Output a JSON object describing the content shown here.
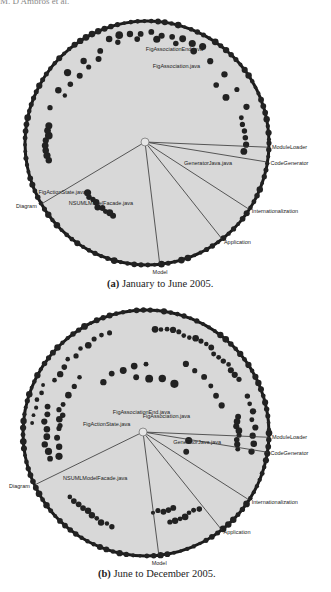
{
  "header": {
    "running_text": "M. D'Ambros et al."
  },
  "chart_data": [
    {
      "type": "radial-graph",
      "id": "a",
      "caption_prefix": "(a)",
      "caption_text": "January to June 2005.",
      "hub": {
        "name": "ArgoUML"
      },
      "module_labels": [
        {
          "name": "ModuleLoader",
          "angle_deg": 2
        },
        {
          "name": "CodeGenerator",
          "angle_deg": 9
        },
        {
          "name": "Internationalization",
          "angle_deg": 33
        },
        {
          "name": "Application",
          "angle_deg": 52
        },
        {
          "name": "Model",
          "angle_deg": 84
        },
        {
          "name": "Diagram",
          "angle_deg": 150
        }
      ],
      "file_labels": [
        {
          "name": "FigAssociationEnd.java",
          "angle_deg": -72,
          "r": 0.78
        },
        {
          "name": "FigAssociation.java",
          "angle_deg": -67,
          "r": 0.66
        },
        {
          "name": "GeneratorJava.java",
          "angle_deg": 20,
          "r": 0.55
        },
        {
          "name": "FigActionState.java",
          "angle_deg": 148,
          "r": 0.8
        },
        {
          "name": "NSUMLModelFacade.java",
          "angle_deg": 125,
          "r": 0.63
        }
      ]
    },
    {
      "type": "radial-graph",
      "id": "b",
      "caption_prefix": "(b)",
      "caption_text": "June to December 2005.",
      "hub": {
        "name": "ArgoUML"
      },
      "module_labels": [
        {
          "name": "ModuleLoader",
          "angle_deg": 2
        },
        {
          "name": "CodeGenerator",
          "angle_deg": 9
        },
        {
          "name": "Internationalization",
          "angle_deg": 33
        },
        {
          "name": "Application",
          "angle_deg": 52
        },
        {
          "name": "Model",
          "angle_deg": 84
        },
        {
          "name": "Diagram",
          "angle_deg": 155
        }
      ],
      "file_labels": [
        {
          "name": "FigAssociationEnd.java",
          "angle_deg": -95,
          "r": 0.15
        },
        {
          "name": "FigAssociation.java",
          "angle_deg": -30,
          "r": 0.22
        },
        {
          "name": "GeneratorJava.java",
          "angle_deg": 12,
          "r": 0.45
        },
        {
          "name": "FigActionState.java",
          "angle_deg": -170,
          "r": 0.3
        },
        {
          "name": "NSUMLModelFacade.java",
          "angle_deg": 135,
          "r": 0.55
        }
      ]
    }
  ],
  "colors": {
    "disk": "#d8d8d8",
    "rim": "#1a1a1a",
    "dot": "#222222",
    "line": "#333333"
  }
}
